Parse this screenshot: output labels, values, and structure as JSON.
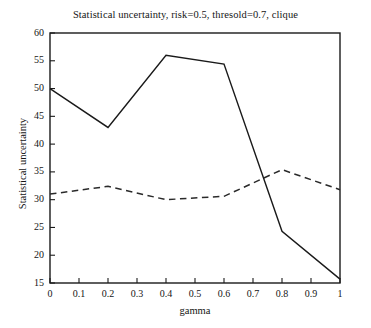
{
  "chart_data": {
    "type": "line",
    "title": "Statistical uncertainty, risk=0.5, thresold=0.7, clique",
    "xlabel": "gamma",
    "ylabel": "Statistical uncertainty",
    "xlim": [
      0,
      1
    ],
    "ylim": [
      15,
      60
    ],
    "grid": false,
    "legend": null,
    "x": [
      0,
      0.2,
      0.4,
      0.6,
      0.8,
      1
    ],
    "xticks": [
      "0",
      "0.1",
      "0.2",
      "0.3",
      "0.4",
      "0.5",
      "0.6",
      "0.7",
      "0.8",
      "0.9",
      "1"
    ],
    "xtick_values": [
      0,
      0.1,
      0.2,
      0.3,
      0.4,
      0.5,
      0.6,
      0.7,
      0.8,
      0.9,
      1
    ],
    "yticks": [
      "15",
      "20",
      "25",
      "30",
      "35",
      "40",
      "45",
      "50",
      "55",
      "60"
    ],
    "ytick_values": [
      15,
      20,
      25,
      30,
      35,
      40,
      45,
      50,
      55,
      60
    ],
    "series": [
      {
        "name": "solid",
        "style": "solid",
        "color": "#1a1a1a",
        "values": [
          50,
          43,
          56,
          54.4,
          24.3,
          15.7
        ]
      },
      {
        "name": "dashed",
        "style": "dashed",
        "color": "#2a2a2a",
        "values": [
          31,
          32.4,
          30,
          30.6,
          35.4,
          31.8
        ]
      }
    ]
  },
  "axes": {
    "frame_color": "#1a1a1a",
    "background": "#ffffff"
  }
}
